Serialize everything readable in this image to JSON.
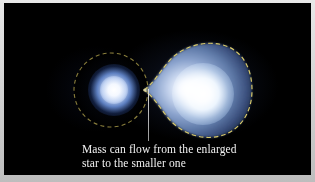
{
  "figure": {
    "background_color": "#000000",
    "frame_color": "#c9c9c9"
  },
  "caption": {
    "full_text": "Mass can flow from the enlarged star to the smaller one",
    "line1": "Mass can flow from the enlarged",
    "line2": "star to the smaller one",
    "color": "#f2f2f2"
  },
  "objects": {
    "small_star": {
      "label": "smaller star",
      "core_color": "#ffffff",
      "halo_color": "#5d7fc0"
    },
    "large_star": {
      "label": "enlarged star",
      "core_color": "#ffffff",
      "body_color": "#6f8cc0"
    },
    "roche_lobe_small": {
      "label": "roche-lobe-small",
      "stroke_color": "#8a7f3c",
      "style": "dashed"
    },
    "roche_lobe_large": {
      "label": "roche-lobe-large",
      "stroke_color": "#d8c96a",
      "style": "dashed"
    },
    "lagrange_point": {
      "label": "L1 inner Lagrange point"
    },
    "pointer": {
      "label": "caption pointer line",
      "color": "#c5c5c5"
    }
  }
}
